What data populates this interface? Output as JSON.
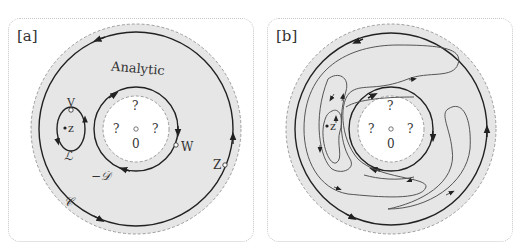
{
  "panels": [
    {
      "tag": "[a]",
      "labels": {
        "region": "Analytic",
        "unknown_top": "?",
        "unknown_left": "?",
        "unknown_right": "?",
        "origin": "0",
        "point_V": "V",
        "point_z": "z",
        "point_W": "W",
        "point_Z": "Z",
        "contour_L": "ℒ",
        "contour_D": "−𝒟",
        "contour_C": "𝒞"
      }
    },
    {
      "tag": "[b]",
      "labels": {
        "unknown_top": "?",
        "unknown_left": "?",
        "unknown_right": "?",
        "origin": "0",
        "point_z": "z"
      }
    }
  ],
  "colors": {
    "annulus_fill": "#e6e6e6",
    "hole_fill": "#ffffff",
    "stroke": "#222222",
    "dashed": "#888888"
  }
}
